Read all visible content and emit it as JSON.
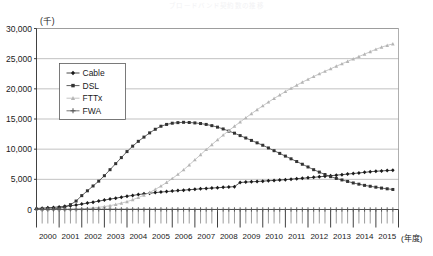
{
  "chart_data": {
    "type": "line",
    "title": "ブロードバンド契約数の推移",
    "unit_label": "(千)",
    "xlabel": "(年度)",
    "ylabel": "",
    "ylim": [
      0,
      30000
    ],
    "ytick_values": [
      0,
      5000,
      10000,
      15000,
      20000,
      25000,
      30000
    ],
    "ytick_labels": [
      "0",
      "5,000",
      "10,000",
      "15,000",
      "20,000",
      "25,000",
      "30,000"
    ],
    "xlim": [
      2000,
      2016
    ],
    "xtick_labels": [
      "2000",
      "2001",
      "2002",
      "2003",
      "2004",
      "2005",
      "2006",
      "2007",
      "2008",
      "2009",
      "2010",
      "2011",
      "2012",
      "2013",
      "2014",
      "2015"
    ],
    "grid": true,
    "minor_ticks_per_year": 4,
    "legend_position": "upper-left",
    "legend_entries": [
      "Cable",
      "DSL",
      "FTTx",
      "FWA"
    ],
    "series": [
      {
        "name": "Cable",
        "color": "#1a1a1a",
        "marker": "diamond",
        "x": [
          2000.0,
          2000.25,
          2000.5,
          2000.75,
          2001.0,
          2001.25,
          2001.5,
          2001.75,
          2002.0,
          2002.25,
          2002.5,
          2002.75,
          2003.0,
          2003.25,
          2003.5,
          2003.75,
          2004.0,
          2004.25,
          2004.5,
          2004.75,
          2005.0,
          2005.25,
          2005.5,
          2005.75,
          2006.0,
          2006.25,
          2006.5,
          2006.75,
          2007.0,
          2007.25,
          2007.5,
          2007.75,
          2008.0,
          2008.25,
          2008.5,
          2008.75,
          2009.0,
          2009.25,
          2009.5,
          2009.75,
          2010.0,
          2010.25,
          2010.5,
          2010.75,
          2011.0,
          2011.25,
          2011.5,
          2011.75,
          2012.0,
          2012.25,
          2012.5,
          2012.75,
          2013.0,
          2013.25,
          2013.5,
          2013.75,
          2014.0,
          2014.25,
          2014.5,
          2014.75,
          2015.0,
          2015.25,
          2015.5,
          2015.75
        ],
        "values": [
          170,
          220,
          280,
          350,
          430,
          520,
          620,
          740,
          900,
          1060,
          1220,
          1390,
          1560,
          1720,
          1880,
          2040,
          2200,
          2340,
          2470,
          2590,
          2700,
          2800,
          2890,
          2970,
          3050,
          3130,
          3210,
          3280,
          3350,
          3420,
          3490,
          3550,
          3610,
          3670,
          3730,
          3790,
          4480,
          4540,
          4590,
          4640,
          4700,
          4760,
          4820,
          4880,
          4950,
          5030,
          5110,
          5180,
          5250,
          5330,
          5420,
          5510,
          5600,
          5690,
          5780,
          5870,
          5960,
          6060,
          6160,
          6260,
          6340,
          6400,
          6450,
          6500
        ]
      },
      {
        "name": "DSL",
        "color": "#333333",
        "marker": "square",
        "x": [
          2000.0,
          2000.25,
          2000.5,
          2000.75,
          2001.0,
          2001.25,
          2001.5,
          2001.75,
          2002.0,
          2002.25,
          2002.5,
          2002.75,
          2003.0,
          2003.25,
          2003.5,
          2003.75,
          2004.0,
          2004.25,
          2004.5,
          2004.75,
          2005.0,
          2005.25,
          2005.5,
          2005.75,
          2006.0,
          2006.25,
          2006.5,
          2006.75,
          2007.0,
          2007.25,
          2007.5,
          2007.75,
          2008.0,
          2008.25,
          2008.5,
          2008.75,
          2009.0,
          2009.25,
          2009.5,
          2009.75,
          2010.0,
          2010.25,
          2010.5,
          2010.75,
          2011.0,
          2011.25,
          2011.5,
          2011.75,
          2012.0,
          2012.25,
          2012.5,
          2012.75,
          2013.0,
          2013.25,
          2013.5,
          2013.75,
          2014.0,
          2014.25,
          2014.5,
          2014.75,
          2015.0,
          2015.25,
          2015.5,
          2015.75
        ],
        "values": [
          20,
          40,
          70,
          120,
          200,
          400,
          800,
          1400,
          2300,
          3100,
          3900,
          4700,
          5600,
          6600,
          7600,
          8600,
          9600,
          10500,
          11300,
          12000,
          12700,
          13300,
          13800,
          14100,
          14300,
          14400,
          14450,
          14420,
          14350,
          14250,
          14100,
          13900,
          13650,
          13350,
          13000,
          12650,
          12250,
          11850,
          11450,
          11050,
          10650,
          10200,
          9750,
          9300,
          8850,
          8400,
          7950,
          7500,
          7050,
          6600,
          6200,
          5800,
          5450,
          5150,
          4900,
          4650,
          4400,
          4200,
          4000,
          3850,
          3700,
          3550,
          3430,
          3320
        ]
      },
      {
        "name": "FTTx",
        "color": "#b5b5b5",
        "marker": "triangle",
        "x": [
          2000.0,
          2000.25,
          2000.5,
          2000.75,
          2001.0,
          2001.25,
          2001.5,
          2001.75,
          2002.0,
          2002.25,
          2002.5,
          2002.75,
          2003.0,
          2003.25,
          2003.5,
          2003.75,
          2004.0,
          2004.25,
          2004.5,
          2004.75,
          2005.0,
          2005.25,
          2005.5,
          2005.75,
          2006.0,
          2006.25,
          2006.5,
          2006.75,
          2007.0,
          2007.25,
          2007.5,
          2007.75,
          2008.0,
          2008.25,
          2008.5,
          2008.75,
          2009.0,
          2009.25,
          2009.5,
          2009.75,
          2010.0,
          2010.25,
          2010.5,
          2010.75,
          2011.0,
          2011.25,
          2011.5,
          2011.75,
          2012.0,
          2012.25,
          2012.5,
          2012.75,
          2013.0,
          2013.25,
          2013.5,
          2013.75,
          2014.0,
          2014.25,
          2014.5,
          2014.75,
          2015.0,
          2015.25,
          2015.5,
          2015.75
        ],
        "values": [
          0,
          0,
          5,
          10,
          20,
          35,
          55,
          80,
          120,
          180,
          260,
          360,
          480,
          640,
          830,
          1050,
          1300,
          1620,
          1980,
          2380,
          2830,
          3330,
          3880,
          4480,
          5130,
          5830,
          6580,
          7380,
          8230,
          9080,
          9930,
          10750,
          11550,
          12330,
          13080,
          13800,
          14500,
          15200,
          15880,
          16540,
          17180,
          17800,
          18400,
          18980,
          19540,
          20080,
          20600,
          21100,
          21580,
          22040,
          22480,
          22900,
          23320,
          23740,
          24150,
          24550,
          24950,
          25350,
          25750,
          26150,
          26550,
          26900,
          27200,
          27450
        ]
      },
      {
        "name": "FWA",
        "color": "#555555",
        "marker": "cross",
        "x": [
          2000.0,
          2000.25,
          2000.5,
          2000.75,
          2001.0,
          2001.25,
          2001.5,
          2001.75,
          2002.0,
          2002.25,
          2002.5,
          2002.75,
          2003.0,
          2003.25,
          2003.5,
          2003.75,
          2004.0,
          2004.25,
          2004.5,
          2004.75,
          2005.0,
          2005.25,
          2005.5,
          2005.75,
          2006.0,
          2006.25,
          2006.5,
          2006.75,
          2007.0,
          2007.25,
          2007.5,
          2007.75,
          2008.0,
          2008.25,
          2008.5,
          2008.75,
          2009.0,
          2009.25,
          2009.5,
          2009.75,
          2010.0,
          2010.25,
          2010.5,
          2010.75,
          2011.0,
          2011.25,
          2011.5,
          2011.75,
          2012.0,
          2012.25,
          2012.5,
          2012.75,
          2013.0,
          2013.25,
          2013.5,
          2013.75,
          2014.0,
          2014.25,
          2014.5,
          2014.75,
          2015.0,
          2015.25,
          2015.5,
          2015.75
        ],
        "values": [
          5,
          8,
          12,
          16,
          20,
          24,
          28,
          32,
          36,
          38,
          40,
          40,
          40,
          39,
          38,
          36,
          34,
          32,
          30,
          28,
          26,
          24,
          22,
          20,
          18,
          16,
          15,
          14,
          13,
          12,
          11,
          10,
          10,
          9,
          9,
          8,
          8,
          8,
          7,
          7,
          7,
          6,
          6,
          6,
          6,
          5,
          5,
          5,
          5,
          5,
          4,
          4,
          4,
          4,
          4,
          3,
          3,
          3,
          3,
          3,
          3,
          3,
          3,
          3
        ]
      }
    ]
  }
}
